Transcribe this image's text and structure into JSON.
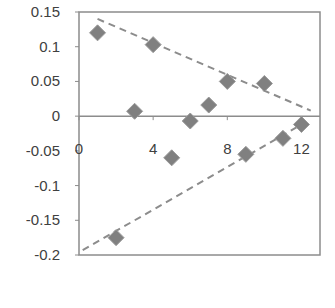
{
  "chart_data": {
    "type": "scatter",
    "title": "",
    "xlabel": "",
    "ylabel": "",
    "xlim": [
      0,
      13
    ],
    "ylim": [
      -0.2,
      0.15
    ],
    "grid": false,
    "legend": null,
    "x_ticks": [
      0,
      4,
      8,
      12
    ],
    "x_tick_labels": [
      "0",
      "4",
      "8",
      "12"
    ],
    "y_ticks": [
      0.15,
      0.1,
      0.05,
      0,
      -0.05,
      -0.1,
      -0.15,
      -0.2
    ],
    "y_tick_labels": [
      "0.15",
      "0.1",
      "0.05",
      "0",
      "-0.05",
      "-0.1",
      "-0.15",
      "-0.2"
    ],
    "series": [
      {
        "name": "points",
        "marker": "diamond",
        "color": "#808080",
        "x": [
          1,
          2,
          3,
          4,
          5,
          6,
          7,
          8,
          9,
          10,
          11,
          12
        ],
        "y": [
          0.12,
          -0.175,
          0.007,
          0.103,
          -0.06,
          -0.007,
          0.016,
          0.05,
          -0.055,
          0.047,
          -0.032,
          -0.012
        ]
      }
    ],
    "annotations": [
      {
        "type": "dashed-line",
        "name": "upper-bound",
        "color": "#8c8c8c",
        "from": [
          1,
          0.14
        ],
        "to": [
          12.5,
          0.008
        ]
      },
      {
        "type": "dashed-line",
        "name": "lower-bound",
        "color": "#8c8c8c",
        "from": [
          0.2,
          -0.193
        ],
        "to": [
          12,
          -0.012
        ]
      }
    ]
  }
}
